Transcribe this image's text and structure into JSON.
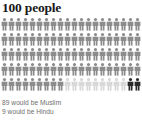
{
  "chart_data": {
    "type": "pictogram",
    "title": "100 people",
    "xlabel": "",
    "ylabel": "",
    "unit_value": 1,
    "unit_icon": "person-icon",
    "total": 100,
    "rows": 5,
    "columns": 20,
    "categories": [
      "Muslim",
      "Hindu",
      "Other"
    ],
    "values": [
      89,
      9,
      2
    ],
    "colors": [
      "#8c8c8c",
      "#d8d8d8",
      "#2b2b2b"
    ],
    "annotations": [
      "89 would be Muslim",
      "9 would be Hindu"
    ],
    "legend_position": "below",
    "grid": false
  },
  "header": {
    "title": "100 people"
  },
  "caption": {
    "lines": [
      "89 would be Muslim",
      "9 would be Hindu"
    ],
    "line_1": "89 would be Muslim",
    "line_2": "9 would be Hindu"
  },
  "colors": {
    "background": "#ffffff",
    "title": "#1a1a1a",
    "caption": "#6e6e6e",
    "figure_muslim": "#8c8c8c",
    "figure_hindu": "#d8d8d8",
    "figure_other": "#2b2b2b"
  },
  "icons": {
    "person": "person-icon"
  }
}
